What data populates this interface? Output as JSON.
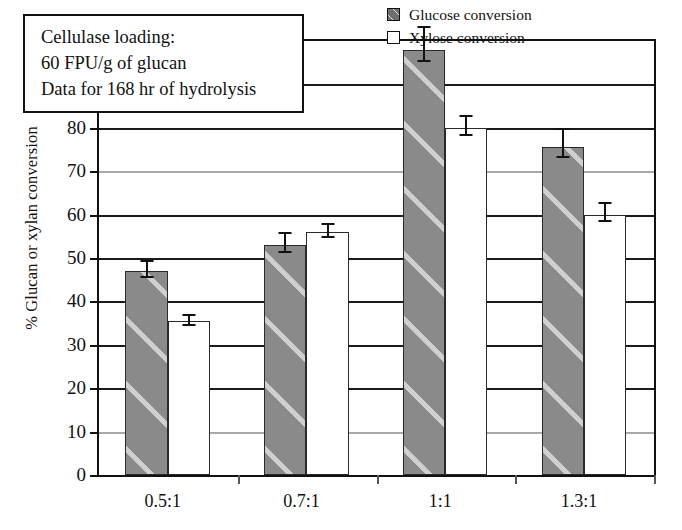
{
  "chart_data": {
    "type": "bar",
    "title": "",
    "xlabel": "",
    "ylabel": "% Glucan or xylan conversion",
    "ylim": [
      0,
      100
    ],
    "ytick_labels": [
      "0",
      "10",
      "20",
      "30",
      "40",
      "50",
      "60",
      "70",
      "80",
      "90",
      "100"
    ],
    "ytick_values": [
      0,
      10,
      20,
      30,
      40,
      50,
      60,
      70,
      80,
      90,
      100
    ],
    "grid": "horizontal",
    "legend_position": "top-right",
    "categories": [
      "0.5:1",
      "0.7:1",
      "1:1",
      "1.3:1"
    ],
    "series": [
      {
        "name": "Glucose conversion",
        "color": "#8a8a8a",
        "pattern": "diagonal-hatch",
        "values": [
          47,
          53,
          98,
          75.5
        ],
        "errors": [
          2.5,
          3,
          5.5,
          4.5
        ]
      },
      {
        "name": "Xylose conversion",
        "color": "#ffffff",
        "pattern": "solid",
        "values": [
          35.5,
          56,
          80,
          60
        ],
        "errors": [
          1.5,
          2,
          3,
          3
        ]
      }
    ],
    "annotation": {
      "line1": "Cellulase loading:",
      "line2": "60 FPU/g of glucan",
      "line3": "Data for 168 hr of hydrolysis"
    }
  },
  "legend": {
    "items": [
      {
        "label": "Glucose conversion",
        "key": "glucose"
      },
      {
        "label": "Xylose conversion",
        "key": "xylose"
      }
    ]
  },
  "colors": {
    "glucose_fill": "#8a8a8a",
    "xylose_fill": "#ffffff",
    "axis": "#111111",
    "gridline": "#1a1a1a",
    "gridline_faint": "#a9a9a9"
  }
}
